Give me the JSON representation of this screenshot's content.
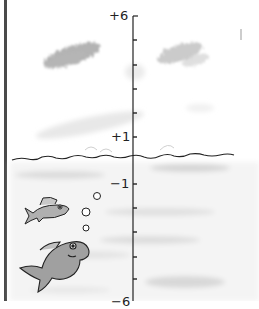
{
  "diagram": {
    "type": "vertical-number-line",
    "theme": "sea level: sky above, water below",
    "axis": {
      "labels": [
        {
          "text": "+6",
          "value": 6,
          "y": 16
        },
        {
          "text": "+1",
          "value": 1,
          "y": 137
        },
        {
          "text": "−1",
          "value": -1,
          "y": 184
        },
        {
          "text": "−6",
          "value": -6,
          "y": 302
        }
      ],
      "tick_values": [
        6,
        5,
        4,
        3,
        2,
        1,
        0,
        -1,
        -2,
        -3,
        -4,
        -5,
        -6
      ],
      "zero_marker": "water surface line"
    },
    "decorations": {
      "clouds": 2,
      "fish": 2,
      "bubbles": 3,
      "right_mark": "|"
    },
    "colors": {
      "ink": "#222222",
      "border": "#4a4a4a",
      "cloud_shade": "#9a9a9a",
      "water_shade": "#cfcfcf",
      "fish_fill": "#a8a8a8"
    }
  }
}
